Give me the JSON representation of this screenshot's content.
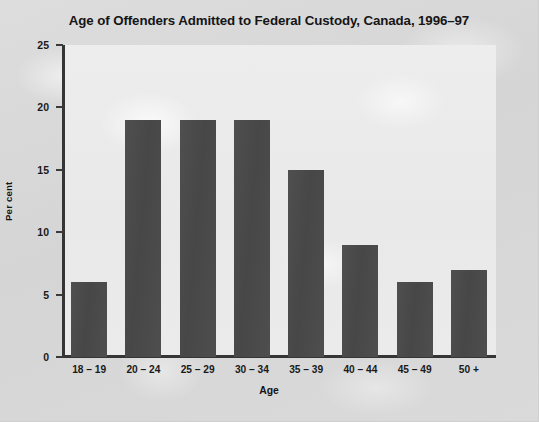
{
  "chart_data": {
    "type": "bar",
    "title": "Age of Offenders Admitted to Federal Custody, Canada, 1996–97",
    "xlabel": "Age",
    "ylabel": "Per cent",
    "categories": [
      "18 – 19",
      "20 – 24",
      "25 – 29",
      "30 – 34",
      "35 – 39",
      "40 – 44",
      "45 – 49",
      "50 +"
    ],
    "values": [
      6,
      19,
      19,
      19,
      15,
      9,
      6,
      7
    ],
    "ylim": [
      0,
      25
    ],
    "yticks": [
      0,
      5,
      10,
      15,
      20,
      25
    ],
    "ytick_labels": [
      "0",
      "5",
      "10",
      "15",
      "20",
      "25"
    ],
    "grid": false,
    "legend": false,
    "bar_color": "#4a4a4a",
    "axis_color": "#353535",
    "plot_background": "#ebebeb",
    "figure_background": "#d9d9d9"
  }
}
